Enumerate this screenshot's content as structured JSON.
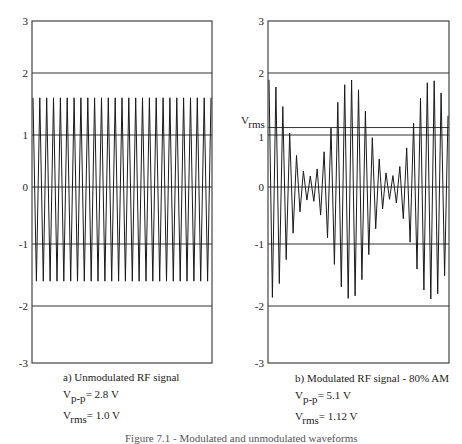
{
  "chart_data": [
    {
      "type": "line",
      "title": "a) Unmodulated RF signal",
      "xlabel": "",
      "ylabel": "",
      "ylim": [
        -3,
        3
      ],
      "yticks": [
        3,
        2,
        1,
        0,
        -1,
        -2,
        -3
      ],
      "grid": "horizontal lines at 2, 1, 0, -1, -2",
      "signal": {
        "kind": "sine",
        "amplitude": 1.6,
        "cycles": 26,
        "modulation_depth": 0
      },
      "annotations": {
        "vpp_label": "V",
        "vpp_sub": "p-p",
        "vpp_value": "= 2.8 V",
        "vrms_label": "V",
        "vrms_sub": "rms",
        "vrms_value": "= 1.0 V"
      }
    },
    {
      "type": "line",
      "title": "b) Modulated RF signal - 80% AM",
      "xlabel": "",
      "ylabel": "",
      "ylim": [
        -3,
        3
      ],
      "yticks": [
        3,
        2,
        1,
        0,
        -1,
        -2,
        -3
      ],
      "grid": "horizontal lines at 2, 1.12 (Vrms), 1, 0, -1, -2",
      "signal": {
        "kind": "am",
        "carrier_amplitude": 1.05,
        "modulation_depth": 0.8,
        "cycles": 26,
        "mod_cycles": 2.2
      },
      "rms_line": 1.12,
      "rms_line_label": "V",
      "rms_line_sub": "rms",
      "annotations": {
        "vpp_label": "V",
        "vpp_sub": "p-p",
        "vpp_value": "= 5.1 V",
        "vrms_label": "V",
        "vrms_sub": "rms",
        "vrms_value": "= 1.12 V"
      }
    }
  ],
  "caption": "Figure 7.1 - Modulated and unmodulated waveforms",
  "colors": {
    "line": "#1a1a1a",
    "frame": "#444444",
    "grid": "#333333"
  }
}
